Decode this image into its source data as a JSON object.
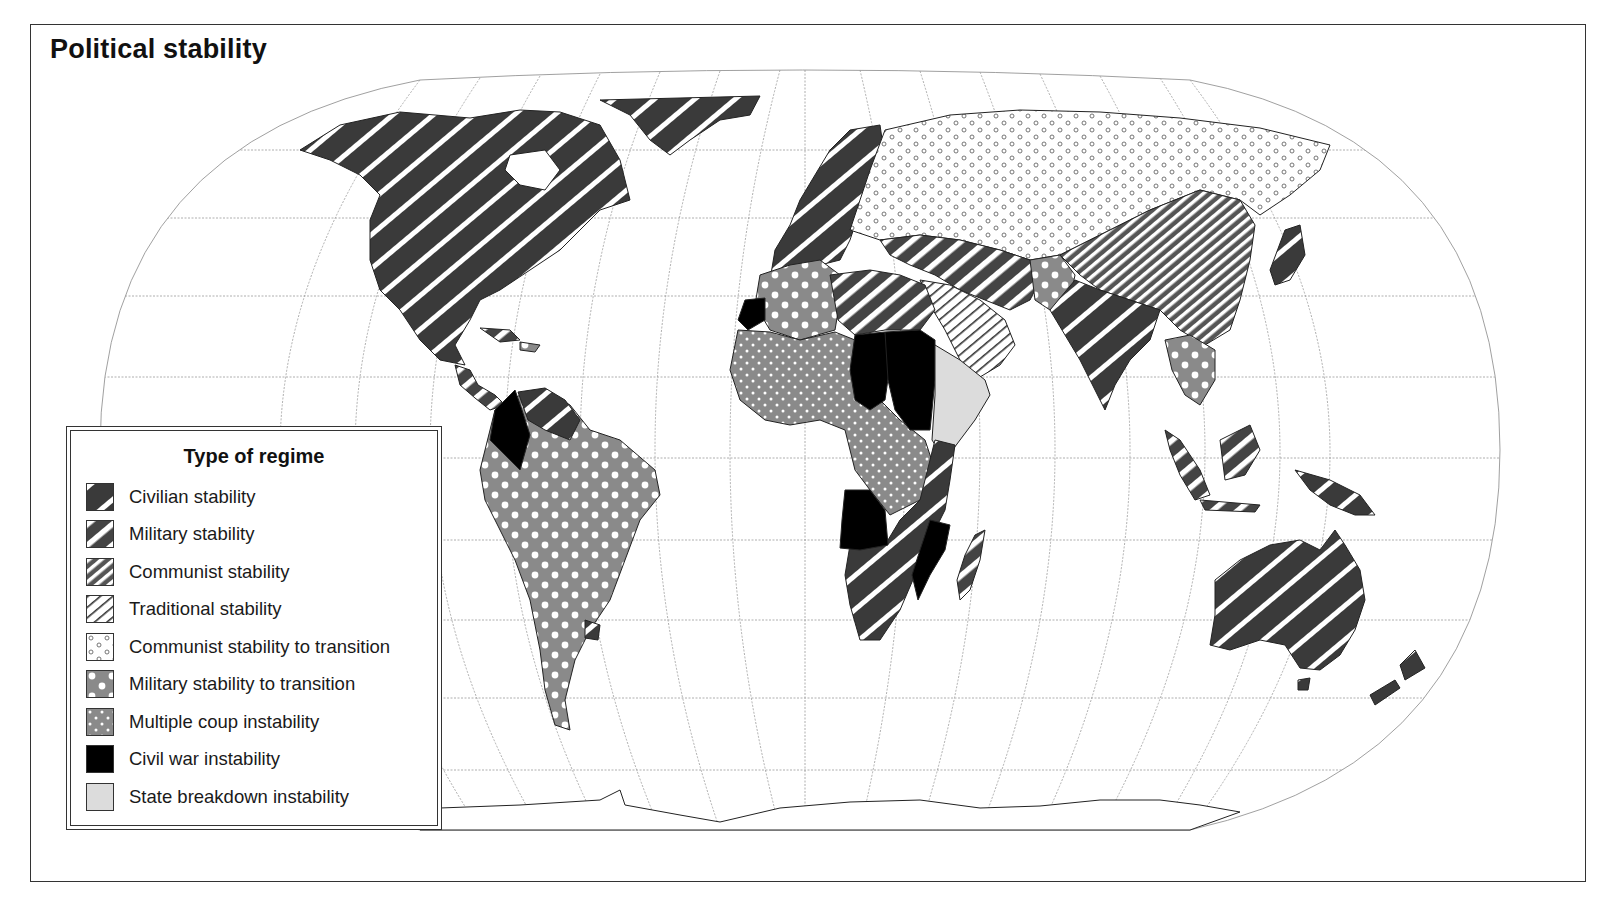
{
  "title": "Political stability",
  "legend": {
    "title": "Type of regime",
    "items": [
      {
        "key": "civilian",
        "label": "Civilian stability",
        "pattern": "dark-wide-diagonal-stripes",
        "fill": "#3a3a3a"
      },
      {
        "key": "military",
        "label": "Military stability",
        "pattern": "medium-diagonal-stripes",
        "fill": "#444444"
      },
      {
        "key": "communist",
        "label": "Communist stability",
        "pattern": "fine-diagonal-stripes",
        "fill": "#555555"
      },
      {
        "key": "traditional",
        "label": "Traditional stability",
        "pattern": "light-diagonal-hatch",
        "fill": "#ffffff"
      },
      {
        "key": "communist_transition",
        "label": "Communist stability to transition",
        "pattern": "small-open-circles",
        "fill": "#ffffff"
      },
      {
        "key": "military_transition",
        "label": "Military stability to transition",
        "pattern": "grey-large-white-dots",
        "fill": "#8a8a8a"
      },
      {
        "key": "multiple_coup",
        "label": "Multiple coup instability",
        "pattern": "grey-small-white-dots",
        "fill": "#8a8a8a"
      },
      {
        "key": "civil_war",
        "label": "Civil war instability",
        "pattern": "solid-black",
        "fill": "#000000"
      },
      {
        "key": "state_breakdown",
        "label": "State breakdown instability",
        "pattern": "solid-light-grey",
        "fill": "#dcdcdc"
      }
    ]
  },
  "map": {
    "projection": "world graticule (Eckert-like)",
    "regions": [
      {
        "name": "North America (USA, Canada, Mexico)",
        "regime": "civilian"
      },
      {
        "name": "Greenland",
        "regime": "civilian"
      },
      {
        "name": "Western Europe",
        "regime": "civilian"
      },
      {
        "name": "Soviet Union / Eastern Europe",
        "regime": "communist_transition"
      },
      {
        "name": "China / Mongolia",
        "regime": "communist"
      },
      {
        "name": "South America",
        "regime": "military_transition"
      },
      {
        "name": "Colombia",
        "regime": "civil_war"
      },
      {
        "name": "Venezuela / Guianas",
        "regime": "civilian"
      },
      {
        "name": "Uruguay",
        "regime": "civilian"
      },
      {
        "name": "North Africa (Libya, Egypt)",
        "regime": "military"
      },
      {
        "name": "Algeria / NW Africa",
        "regime": "military_transition"
      },
      {
        "name": "Western Sahara",
        "regime": "civil_war"
      },
      {
        "name": "West & Central Africa",
        "regime": "multiple_coup"
      },
      {
        "name": "Chad",
        "regime": "civil_war"
      },
      {
        "name": "Sudan",
        "regime": "civil_war"
      },
      {
        "name": "Ethiopia / Somalia",
        "regime": "state_breakdown"
      },
      {
        "name": "Angola",
        "regime": "civil_war"
      },
      {
        "name": "Mozambique",
        "regime": "civil_war"
      },
      {
        "name": "Southern & East Africa",
        "regime": "civilian"
      },
      {
        "name": "Madagascar",
        "regime": "military"
      },
      {
        "name": "Saudi Arabia / Arabian Peninsula",
        "regime": "traditional"
      },
      {
        "name": "Turkey / Middle East / Iran",
        "regime": "military"
      },
      {
        "name": "Afghanistan",
        "regime": "military_transition"
      },
      {
        "name": "India / Pakistan",
        "regime": "civilian"
      },
      {
        "name": "Indochina",
        "regime": "military_transition"
      },
      {
        "name": "Indonesia / SE Asian islands",
        "regime": "military"
      },
      {
        "name": "Japan",
        "regime": "civilian"
      },
      {
        "name": "Australia",
        "regime": "civilian"
      },
      {
        "name": "New Zealand",
        "regime": "civilian"
      },
      {
        "name": "Papua New Guinea",
        "regime": "civilian"
      },
      {
        "name": "Antarctica",
        "regime": "none"
      }
    ]
  },
  "colors": {
    "ink": "#111111",
    "dark": "#3a3a3a",
    "grey": "#8a8a8a",
    "light_grey": "#dcdcdc",
    "graticule": "#9a9a9a",
    "paper": "#ffffff"
  }
}
